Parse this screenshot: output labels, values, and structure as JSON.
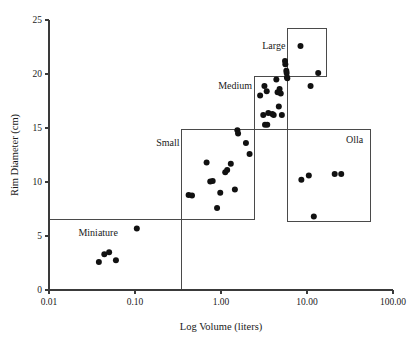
{
  "chart_data": {
    "type": "scatter",
    "title": "",
    "xlabel": "Log Volume (liters)",
    "ylabel": "Rim Diameter (cm)",
    "x_scale": "log",
    "xlim": [
      0.01,
      100.0
    ],
    "ylim": [
      0,
      25
    ],
    "grid": false,
    "legend_position": "none",
    "xticks": [
      0.01,
      0.1,
      1.0,
      10.0,
      100.0
    ],
    "xtick_labels": [
      "0.01",
      "0.10",
      "1.00",
      "10.00",
      "100.00"
    ],
    "yticks": [
      0,
      5,
      10,
      15,
      20,
      25
    ],
    "ytick_labels": [
      "0",
      "5",
      "10",
      "15",
      "20",
      "25"
    ],
    "point_color": "#111111",
    "box_color": "#4a4a4a",
    "axis_color": "#3a3a3a",
    "annotations": [
      {
        "label": "Miniature",
        "label_x": 0.022,
        "label_y": 5.0,
        "anchor": "start",
        "box": {
          "x0": 0.01,
          "x1": 0.35,
          "y0": 0.0,
          "y1": 6.5
        }
      },
      {
        "label": "Small",
        "label_x": 0.33,
        "label_y": 13.3,
        "anchor": "end",
        "box": {
          "x0": 0.35,
          "x1": 2.45,
          "y0": 6.5,
          "y1": 14.85
        }
      },
      {
        "label": "Medium",
        "label_x": 2.3,
        "label_y": 18.6,
        "anchor": "end",
        "box": {
          "x0": 2.45,
          "x1": 6.0,
          "y0": 14.85,
          "y1": 19.75
        }
      },
      {
        "label": "Large",
        "label_x": 5.6,
        "label_y": 22.3,
        "anchor": "end",
        "box": {
          "x0": 6.0,
          "x1": 17.0,
          "y0": 19.75,
          "y1": 24.2
        }
      },
      {
        "label": "Olla",
        "label_x": 45.0,
        "label_y": 13.6,
        "anchor": "end",
        "box": {
          "x0": 6.0,
          "x1": 55.0,
          "y0": 6.35,
          "y1": 14.85
        }
      }
    ],
    "points": [
      {
        "x": 0.038,
        "y": 2.6
      },
      {
        "x": 0.044,
        "y": 3.3
      },
      {
        "x": 0.05,
        "y": 3.5
      },
      {
        "x": 0.06,
        "y": 2.75
      },
      {
        "x": 0.105,
        "y": 5.7
      },
      {
        "x": 0.42,
        "y": 8.8
      },
      {
        "x": 0.46,
        "y": 8.75
      },
      {
        "x": 0.68,
        "y": 11.8
      },
      {
        "x": 0.75,
        "y": 10.05
      },
      {
        "x": 0.8,
        "y": 10.1
      },
      {
        "x": 0.9,
        "y": 7.6
      },
      {
        "x": 0.98,
        "y": 9.0
      },
      {
        "x": 1.12,
        "y": 10.9
      },
      {
        "x": 1.18,
        "y": 11.1
      },
      {
        "x": 1.3,
        "y": 11.7
      },
      {
        "x": 1.45,
        "y": 9.3
      },
      {
        "x": 1.55,
        "y": 14.8
      },
      {
        "x": 1.58,
        "y": 14.5
      },
      {
        "x": 1.95,
        "y": 13.6
      },
      {
        "x": 2.15,
        "y": 12.6
      },
      {
        "x": 2.85,
        "y": 18.0
      },
      {
        "x": 3.1,
        "y": 16.2
      },
      {
        "x": 3.2,
        "y": 18.9
      },
      {
        "x": 3.25,
        "y": 15.3
      },
      {
        "x": 3.4,
        "y": 18.4
      },
      {
        "x": 3.45,
        "y": 15.3
      },
      {
        "x": 3.55,
        "y": 16.4
      },
      {
        "x": 3.95,
        "y": 16.3
      },
      {
        "x": 4.1,
        "y": 16.2
      },
      {
        "x": 4.4,
        "y": 19.5
      },
      {
        "x": 4.55,
        "y": 18.3
      },
      {
        "x": 4.7,
        "y": 17.0
      },
      {
        "x": 4.8,
        "y": 18.6
      },
      {
        "x": 4.95,
        "y": 18.2
      },
      {
        "x": 5.1,
        "y": 16.2
      },
      {
        "x": 5.55,
        "y": 21.2
      },
      {
        "x": 5.6,
        "y": 20.9
      },
      {
        "x": 5.75,
        "y": 20.3
      },
      {
        "x": 5.8,
        "y": 20.1
      },
      {
        "x": 5.85,
        "y": 19.7
      },
      {
        "x": 5.9,
        "y": 19.6
      },
      {
        "x": 8.4,
        "y": 22.6
      },
      {
        "x": 8.6,
        "y": 10.2
      },
      {
        "x": 10.5,
        "y": 10.6
      },
      {
        "x": 11.0,
        "y": 18.9
      },
      {
        "x": 12.0,
        "y": 6.8
      },
      {
        "x": 13.5,
        "y": 20.1
      },
      {
        "x": 21.0,
        "y": 10.75
      },
      {
        "x": 25.0,
        "y": 10.75
      }
    ]
  }
}
